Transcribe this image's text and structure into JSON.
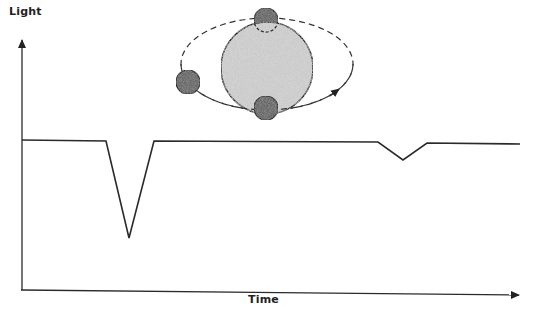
{
  "diagram": {
    "y_axis": {
      "label": "Light"
    },
    "x_axis": {
      "label": "Time"
    },
    "colors": {
      "line": "#2a2a2a",
      "star_fill": "#d2d2d2",
      "planet_fill": "#6b6b6b",
      "orbit": "#333333"
    },
    "star": {
      "cx": 267,
      "cy": 68,
      "r": 46
    },
    "orbit": {
      "cx": 267,
      "cy": 64,
      "rx": 86,
      "ry": 46,
      "style": "dashed",
      "direction_arrow": "counterclockwise-front-to-right"
    },
    "planets": [
      {
        "position": "behind-star (secondary eclipse)",
        "cx": 266,
        "cy": 20,
        "r": 12
      },
      {
        "position": "left",
        "cx": 188,
        "cy": 82,
        "r": 12
      },
      {
        "position": "in-front-of-star (transit)",
        "cx": 266,
        "cy": 108,
        "r": 12
      }
    ],
    "light_curve": {
      "description": "Flat baseline with deep primary transit dip and shallow secondary eclipse dip",
      "points": [
        [
          22,
          140
        ],
        [
          106,
          141
        ],
        [
          129,
          238
        ],
        [
          154,
          141
        ],
        [
          378,
          142
        ],
        [
          403,
          160
        ],
        [
          427,
          143
        ],
        [
          520,
          144
        ]
      ],
      "features": [
        {
          "name": "primary transit",
          "depth": "deep"
        },
        {
          "name": "secondary eclipse",
          "depth": "shallow"
        }
      ]
    }
  }
}
